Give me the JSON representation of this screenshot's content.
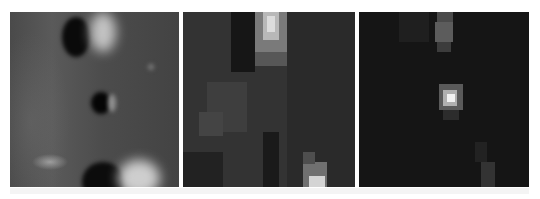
{
  "figure": {
    "background_color": "#ffffff",
    "panels": [
      {
        "id": "panel-1",
        "kind": "smooth surface with craters",
        "base_color": "#4a4a4a",
        "features": [
          {
            "type": "dark-crater",
            "x": 52,
            "y": 5,
            "w": 28,
            "h": 40,
            "color": "#0a0a0a"
          },
          {
            "type": "bright-rim",
            "x": 80,
            "y": 0,
            "w": 26,
            "h": 40,
            "color": "#d8d8d8"
          },
          {
            "type": "dark-crater",
            "x": 81,
            "y": 80,
            "w": 20,
            "h": 22,
            "color": "#050505"
          },
          {
            "type": "faint-rim",
            "x": 98,
            "y": 82,
            "w": 8,
            "h": 18,
            "color": "#909090"
          },
          {
            "type": "speck",
            "x": 138,
            "y": 52,
            "w": 6,
            "h": 6,
            "color": "#7a7a7a"
          },
          {
            "type": "dark-crater",
            "x": 72,
            "y": 150,
            "w": 42,
            "h": 40,
            "color": "#0c0c0c"
          },
          {
            "type": "bright-rim",
            "x": 108,
            "y": 148,
            "w": 42,
            "h": 36,
            "color": "#e6e6e6"
          }
        ]
      },
      {
        "id": "panel-2",
        "kind": "pixelated low-resolution",
        "base_color": "#2e2e2e",
        "blocks": [
          {
            "x": 0,
            "y": 0,
            "w": 172,
            "h": 175,
            "c": "#333333"
          },
          {
            "x": 48,
            "y": 0,
            "w": 24,
            "h": 60,
            "c": "#161616"
          },
          {
            "x": 0,
            "y": 140,
            "w": 40,
            "h": 35,
            "c": "#222222"
          },
          {
            "x": 24,
            "y": 70,
            "w": 40,
            "h": 50,
            "c": "#3e3e3e"
          },
          {
            "x": 16,
            "y": 100,
            "w": 24,
            "h": 24,
            "c": "#444444"
          },
          {
            "x": 72,
            "y": 0,
            "w": 32,
            "h": 40,
            "c": "#7a7a7a"
          },
          {
            "x": 80,
            "y": 0,
            "w": 16,
            "h": 28,
            "c": "#b8b8b8"
          },
          {
            "x": 84,
            "y": 4,
            "w": 8,
            "h": 16,
            "c": "#dcdcdc"
          },
          {
            "x": 72,
            "y": 40,
            "w": 32,
            "h": 14,
            "c": "#575757"
          },
          {
            "x": 104,
            "y": 0,
            "w": 68,
            "h": 175,
            "c": "#2a2a2a"
          },
          {
            "x": 80,
            "y": 120,
            "w": 16,
            "h": 55,
            "c": "#1a1a1a"
          },
          {
            "x": 120,
            "y": 150,
            "w": 24,
            "h": 25,
            "c": "#707070"
          },
          {
            "x": 126,
            "y": 164,
            "w": 16,
            "h": 11,
            "c": "#d4d4d4"
          },
          {
            "x": 120,
            "y": 140,
            "w": 12,
            "h": 12,
            "c": "#4e4e4e"
          }
        ]
      },
      {
        "id": "panel-3",
        "kind": "dark pixelated",
        "base_color": "#141414",
        "blocks": [
          {
            "x": 0,
            "y": 0,
            "w": 170,
            "h": 175,
            "c": "#151515"
          },
          {
            "x": 40,
            "y": 0,
            "w": 30,
            "h": 30,
            "c": "#1f1f1f"
          },
          {
            "x": 78,
            "y": 0,
            "w": 16,
            "h": 10,
            "c": "#4a4a4a"
          },
          {
            "x": 76,
            "y": 10,
            "w": 18,
            "h": 20,
            "c": "#5c5c5c"
          },
          {
            "x": 78,
            "y": 30,
            "w": 14,
            "h": 10,
            "c": "#3c3c3c"
          },
          {
            "x": 80,
            "y": 72,
            "w": 24,
            "h": 26,
            "c": "#5a5a5a"
          },
          {
            "x": 84,
            "y": 78,
            "w": 14,
            "h": 16,
            "c": "#b0b0b0"
          },
          {
            "x": 88,
            "y": 82,
            "w": 8,
            "h": 8,
            "c": "#f2f2f2"
          },
          {
            "x": 84,
            "y": 98,
            "w": 16,
            "h": 10,
            "c": "#2c2c2c"
          },
          {
            "x": 122,
            "y": 150,
            "w": 14,
            "h": 25,
            "c": "#333333"
          },
          {
            "x": 116,
            "y": 130,
            "w": 12,
            "h": 20,
            "c": "#222222"
          }
        ]
      }
    ]
  }
}
